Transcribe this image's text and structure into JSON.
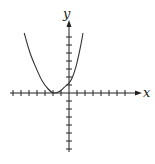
{
  "chart_data": {
    "type": "line",
    "title": "",
    "xlabel": "x",
    "ylabel": "y",
    "grid": false,
    "legend": null,
    "origin_px": [
      69,
      93
    ],
    "unit_px": 8,
    "x_ticks": [
      -7,
      -6,
      -5,
      -4,
      -3,
      -2,
      -1,
      1,
      2,
      3,
      4,
      5,
      6,
      7
    ],
    "y_ticks": [
      -7,
      -6,
      -5,
      -4,
      -3,
      -2,
      -1,
      1,
      2,
      3,
      4,
      5,
      6,
      7
    ],
    "x_range_px": [
      10,
      142
    ],
    "y_range_px": [
      20,
      152
    ],
    "xlim": [
      -7.4,
      9.1
    ],
    "ylim": [
      -7.4,
      9.1
    ],
    "series": [
      {
        "name": "parabola",
        "shape": "upward-opening parabola, vertex near (-2, 0), y-intercept near 1",
        "x": [
          -5.6,
          -4.9,
          -4.1,
          -3.4,
          -2.6,
          -1.9,
          -1.1,
          -0.4,
          0,
          0.4,
          0.9,
          1.4,
          1.75
        ],
        "y": [
          7.5,
          5.1,
          3.1,
          1.6,
          0.5,
          0.0,
          0.25,
          0.9,
          1.25,
          1.9,
          3.4,
          5.6,
          7.5
        ]
      }
    ]
  },
  "labels": {
    "x": "x",
    "y": "y"
  },
  "colors": {
    "axis": "#222222",
    "curve": "#333333"
  }
}
